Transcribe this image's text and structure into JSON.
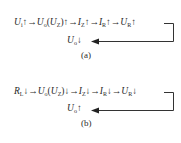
{
  "diagram_a": {
    "chain": [
      {
        "sym": "U",
        "sub": "i",
        "dir": "↑"
      },
      {
        "sym": "U",
        "sub": "o",
        "paren": {
          "sym": "U",
          "sub": "Z"
        },
        "dir": "↑"
      },
      {
        "sym": "I",
        "sub": "Z",
        "dir": "↑"
      },
      {
        "sym": "I",
        "sub": "R",
        "dir": "↑"
      },
      {
        "sym": "U",
        "sub": "R",
        "dir": "↑"
      }
    ],
    "arrow": "→",
    "i1": "U",
    "i1s": "i",
    "i1d": "↑",
    "i2": "U",
    "i2s": "o",
    "i2p": "U",
    "i2ps": "Z",
    "i2d": "↑",
    "i3": "I",
    "i3s": "Z",
    "i3d": "↑",
    "i4": "I",
    "i4s": "R",
    "i4d": "↑",
    "i5": "U",
    "i5s": "R",
    "i5d": "↑",
    "result": {
      "sym": "U",
      "sub": "o",
      "dir": "↓"
    },
    "caption": "(a)"
  },
  "diagram_b": {
    "chain": [
      {
        "sym": "R",
        "sub": "L",
        "dir": "↓"
      },
      {
        "sym": "U",
        "sub": "o",
        "paren": {
          "sym": "U",
          "sub": "Z"
        },
        "dir": "↓"
      },
      {
        "sym": "I",
        "sub": "Z",
        "dir": "↓"
      },
      {
        "sym": "I",
        "sub": "R",
        "dir": "↓"
      },
      {
        "sym": "U",
        "sub": "R",
        "dir": "↓"
      }
    ],
    "arrow": "→",
    "i1": "R",
    "i1s": "L",
    "i1d": "↓",
    "i2": "U",
    "i2s": "o",
    "i2p": "U",
    "i2ps": "Z",
    "i2d": "↓",
    "i3": "I",
    "i3s": "Z",
    "i3d": "↓",
    "i4": "I",
    "i4s": "R",
    "i4d": "↓",
    "i5": "U",
    "i5s": "R",
    "i5d": "↓",
    "result": {
      "sym": "U",
      "sub": "o",
      "dir": "↑"
    },
    "caption": "(b)"
  },
  "colors": {
    "text": "#2a2a2a",
    "line": "#333333",
    "background": "#ffffff"
  }
}
